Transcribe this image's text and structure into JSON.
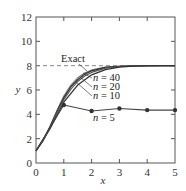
{
  "chart_data": {
    "type": "line",
    "title": "",
    "xlabel": "x",
    "ylabel": "y",
    "xlim": [
      0,
      5
    ],
    "ylim": [
      0,
      12
    ],
    "xticks": [
      0,
      1,
      2,
      3,
      4,
      5
    ],
    "yticks": [
      0,
      2,
      4,
      6,
      8,
      10,
      12
    ],
    "grid": false,
    "series": [
      {
        "name": "Exact",
        "style": "dashed-asymptote-and-curve",
        "x": [
          0,
          0.25,
          0.5,
          0.75,
          1.0,
          1.25,
          1.5,
          1.75,
          2.0,
          2.5,
          3.0,
          3.5,
          4.0,
          5.0
        ],
        "values": [
          1.0,
          1.9,
          3.0,
          4.3,
          5.5,
          6.4,
          7.0,
          7.4,
          7.65,
          7.88,
          7.96,
          7.99,
          8.0,
          8.0
        ]
      },
      {
        "name": "n = 40",
        "x": [
          0,
          0.25,
          0.5,
          0.75,
          1.0,
          1.25,
          1.5,
          1.75,
          2.0,
          2.5,
          3.0,
          3.5,
          4.0,
          5.0
        ],
        "values": [
          1.0,
          1.85,
          2.95,
          4.2,
          5.35,
          6.25,
          6.85,
          7.3,
          7.58,
          7.85,
          7.95,
          7.99,
          8.0,
          8.0
        ]
      },
      {
        "name": "n = 20",
        "x": [
          0,
          0.25,
          0.5,
          0.75,
          1.0,
          1.25,
          1.5,
          1.75,
          2.0,
          2.5,
          3.0,
          3.5,
          4.0,
          5.0
        ],
        "values": [
          1.0,
          1.8,
          2.9,
          4.1,
          5.2,
          6.05,
          6.7,
          7.15,
          7.45,
          7.8,
          7.93,
          7.98,
          8.0,
          8.0
        ]
      },
      {
        "name": "n = 10",
        "x": [
          0,
          0.5,
          1.0,
          1.5,
          2.0,
          2.5,
          3.0,
          3.5,
          4.0,
          4.5,
          5.0
        ],
        "values": [
          1.0,
          2.8,
          5.0,
          6.4,
          7.25,
          7.68,
          7.88,
          7.96,
          7.99,
          8.0,
          8.0
        ]
      },
      {
        "name": "n = 5",
        "markers": true,
        "x": [
          0,
          1,
          2,
          3,
          4,
          5
        ],
        "values": [
          1.0,
          4.77,
          4.27,
          4.48,
          4.35,
          4.35
        ]
      }
    ],
    "asymptote": {
      "y": 8,
      "label": "Exact",
      "style": "dashed"
    },
    "annotations": [
      {
        "text": "Exact",
        "target": "Exact"
      },
      {
        "text": "n = 40",
        "target": "n = 40"
      },
      {
        "text": "n = 20",
        "target": "n = 20"
      },
      {
        "text": "n = 10",
        "target": "n = 10"
      },
      {
        "text": "n = 5",
        "target": "n = 5"
      }
    ]
  },
  "labels": {
    "exact": "Exact",
    "n40": "40",
    "n20": "20",
    "n10": "10",
    "n5": "5",
    "n_var": "n",
    "eq": " = ",
    "x_axis": "x",
    "y_axis": "y",
    "xticks": [
      "0",
      "1",
      "2",
      "3",
      "4",
      "5"
    ],
    "yticks": [
      "0",
      "2",
      "4",
      "6",
      "8",
      "10",
      "12"
    ]
  }
}
